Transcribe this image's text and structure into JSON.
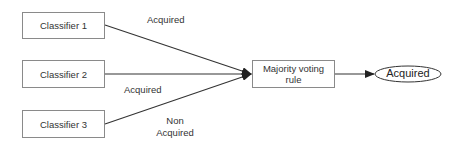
{
  "diagram": {
    "classifiers": [
      {
        "label": "Classifier 1"
      },
      {
        "label": "Classifier 2"
      },
      {
        "label": "Classifier 3"
      }
    ],
    "edge_labels": [
      {
        "text": "Acquired"
      },
      {
        "text": "Acquired"
      },
      {
        "text_line1": "Non",
        "text_line2": "Acquired"
      }
    ],
    "aggregator": {
      "line1": "Majority voting",
      "line2": "rule"
    },
    "output": {
      "label": "Acquired"
    },
    "colors": {
      "stroke": "#333333",
      "box_border": "#8a8a8a",
      "text": "#333333"
    }
  }
}
